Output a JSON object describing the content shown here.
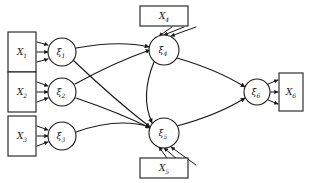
{
  "diagram": {
    "type": "path-diagram",
    "background_color": "#ffffff",
    "stroke_color": "#1a1a1a",
    "observed_nodes": [
      {
        "id": "X1",
        "label": "X",
        "subscript": "1",
        "shape": "rectangle",
        "x": 22,
        "y": 52,
        "w": 28,
        "h": 40
      },
      {
        "id": "X2",
        "label": "X",
        "subscript": "2",
        "shape": "rectangle",
        "x": 22,
        "y": 92,
        "w": 28,
        "h": 40
      },
      {
        "id": "X3",
        "label": "X",
        "subscript": "3",
        "shape": "rectangle",
        "x": 22,
        "y": 136,
        "w": 28,
        "h": 40
      },
      {
        "id": "X4",
        "label": "X",
        "subscript": "4",
        "shape": "rectangle",
        "x": 162,
        "y": 16,
        "w": 44,
        "h": 20
      },
      {
        "id": "X5",
        "label": "X",
        "subscript": "5",
        "shape": "rectangle",
        "x": 162,
        "y": 166,
        "w": 44,
        "h": 20
      },
      {
        "id": "X6",
        "label": "X",
        "subscript": "6",
        "shape": "rectangle",
        "x": 290,
        "y": 92,
        "w": 26,
        "h": 38
      }
    ],
    "latent_nodes": [
      {
        "id": "xi1",
        "label": "ξ",
        "subscript": "1",
        "shape": "circle",
        "x": 62,
        "y": 52,
        "r": 14
      },
      {
        "id": "xi2",
        "label": "ξ",
        "subscript": "2",
        "shape": "circle",
        "x": 62,
        "y": 92,
        "r": 14
      },
      {
        "id": "xi3",
        "label": "ξ",
        "subscript": "3",
        "shape": "circle",
        "x": 62,
        "y": 136,
        "r": 14
      },
      {
        "id": "xi4",
        "label": "ξ",
        "subscript": "4",
        "shape": "circle",
        "x": 164,
        "y": 50,
        "r": 15
      },
      {
        "id": "xi5",
        "label": "ξ",
        "subscript": "5",
        "shape": "circle",
        "x": 164,
        "y": 133,
        "r": 15
      },
      {
        "id": "xi6",
        "label": "ξ",
        "subscript": "6",
        "shape": "circle",
        "x": 257,
        "y": 92,
        "r": 13
      }
    ],
    "measurement_edges": [
      {
        "from": "X1",
        "to": "xi1",
        "count": 3,
        "direction": "right"
      },
      {
        "from": "X2",
        "to": "xi2",
        "count": 3,
        "direction": "right"
      },
      {
        "from": "X3",
        "to": "xi3",
        "count": 3,
        "direction": "right"
      },
      {
        "from": "X4",
        "to": "xi4",
        "count": 3,
        "direction": "down"
      },
      {
        "from": "X5",
        "to": "xi5",
        "count": 3,
        "direction": "up"
      },
      {
        "from": "xi6",
        "to": "X6",
        "count": 3,
        "direction": "right"
      }
    ],
    "structural_edges": [
      {
        "from": "xi1",
        "to": "xi4"
      },
      {
        "from": "xi1",
        "to": "xi5"
      },
      {
        "from": "xi2",
        "to": "xi4"
      },
      {
        "from": "xi2",
        "to": "xi5"
      },
      {
        "from": "xi3",
        "to": "xi5"
      },
      {
        "from": "xi4",
        "to": "xi5"
      },
      {
        "from": "xi4",
        "to": "xi6"
      },
      {
        "from": "xi5",
        "to": "xi6"
      }
    ]
  }
}
